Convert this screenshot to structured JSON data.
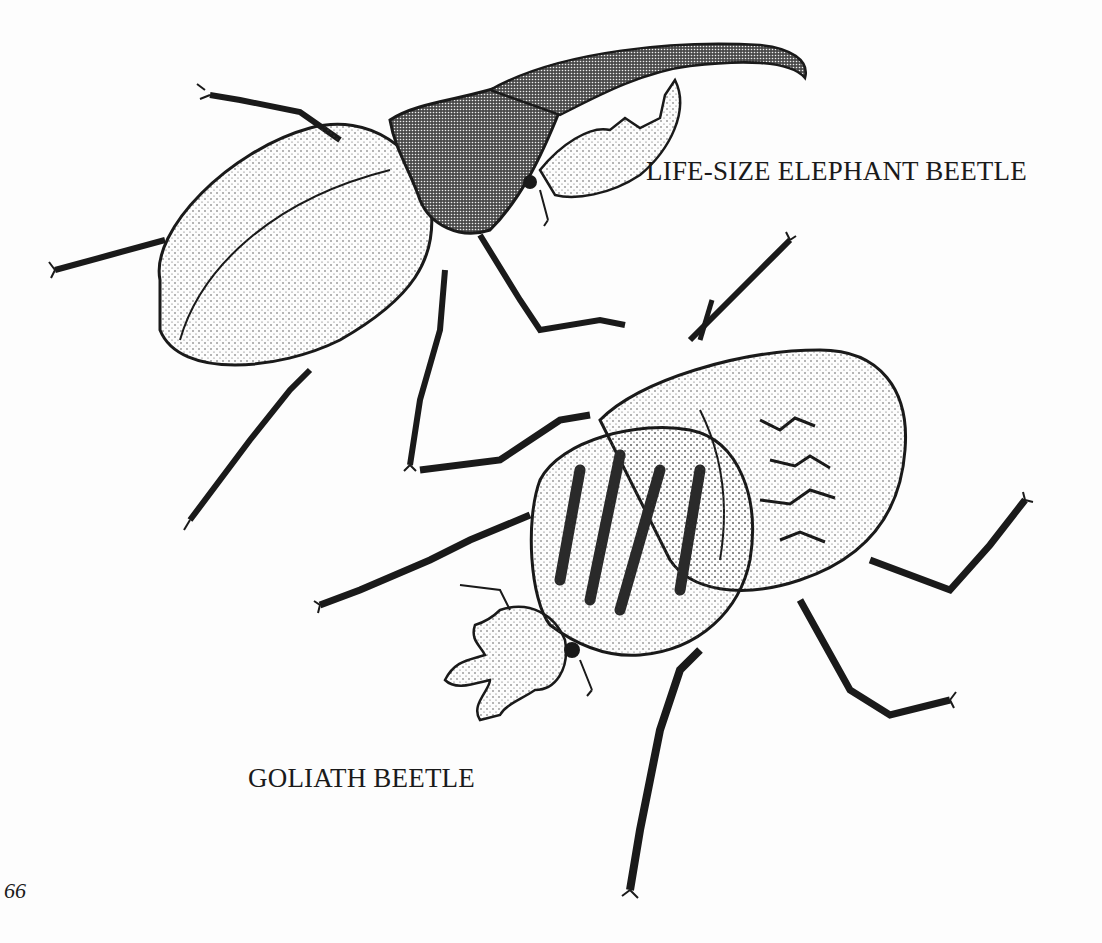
{
  "page": {
    "page_number": "66",
    "illustrations": [
      {
        "name": "elephant-beetle-illustration",
        "caption": "LIFE-SIZE ELEPHANT BEETLE"
      },
      {
        "name": "goliath-beetle-illustration",
        "caption": "GOLIATH BEETLE"
      }
    ]
  },
  "colors": {
    "ink": "#1a1a1a",
    "paper": "#fdfdfd"
  }
}
